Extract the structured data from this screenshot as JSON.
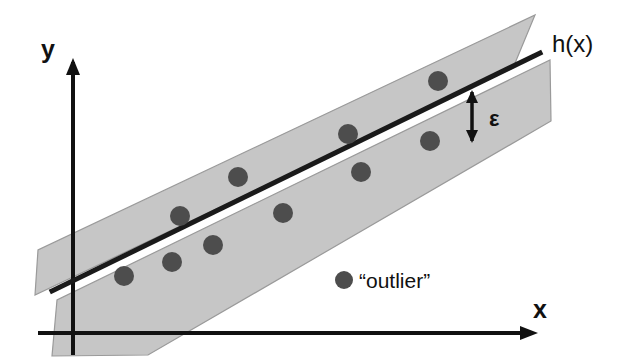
{
  "figure": {
    "background_color": "#ffffff",
    "width": 625,
    "height": 360
  },
  "colors": {
    "band_fill": "#c6c6c6",
    "band_stroke": "#9a9a9a",
    "line": "#1a1a1a",
    "axis": "#111111",
    "point": "#4d4d4d",
    "text": "#111111"
  },
  "labels": {
    "y_axis": "y",
    "x_axis": "x",
    "hypothesis": "h(x)",
    "epsilon": "ε",
    "outlier": "“outlier”"
  },
  "axes": {
    "origin": {
      "x": 73,
      "y": 333
    },
    "y_axis": {
      "x": 73,
      "y_top": 62,
      "y_bottom": 355,
      "arrow": "up"
    },
    "x_axis": {
      "y": 333,
      "x_left": 38,
      "x_right": 533,
      "arrow": "right"
    },
    "y_label_pos": {
      "x": 48,
      "y": 58
    },
    "x_label_pos": {
      "x": 540,
      "y": 318
    }
  },
  "regression_line": {
    "name": "h(x)",
    "x1": 52,
    "y1": 291,
    "x2": 540,
    "y2": 53,
    "stroke_width": 5,
    "label_pos": {
      "x": 552,
      "y": 52
    }
  },
  "bands": {
    "description": "Two offset gray parallelogram slabs forming the epsilon tube above and below h(x)",
    "upper": {
      "name": "upper-epsilon-band",
      "points": "38,250 35,295 513,68 535,15"
    },
    "lower": {
      "name": "lower-epsilon-band",
      "points": "57,300 52,356 148,355 551,121 550,60"
    }
  },
  "epsilon_marker": {
    "label": "ε",
    "arrow_x": 472,
    "arrow_top_y": 92,
    "arrow_bottom_y": 141,
    "label_pos": {
      "x": 489,
      "y": 126
    },
    "double_headed": true
  },
  "chart_data": {
    "type": "scatter",
    "xlabel": "x",
    "ylabel": "y",
    "grid": false,
    "legend": [
      "“outlier”"
    ],
    "annotations": [
      "h(x)",
      "ε",
      "“outlier”"
    ],
    "series": [
      {
        "name": "data-points",
        "marker": "filled-circle",
        "color": "#4d4d4d",
        "radius": 10,
        "points": [
          {
            "x": 124,
            "y": 276
          },
          {
            "x": 172,
            "y": 262
          },
          {
            "x": 213,
            "y": 245
          },
          {
            "x": 180,
            "y": 216
          },
          {
            "x": 238,
            "y": 177
          },
          {
            "x": 283,
            "y": 213
          },
          {
            "x": 348,
            "y": 134
          },
          {
            "x": 361,
            "y": 172
          },
          {
            "x": 430,
            "y": 141
          },
          {
            "x": 438,
            "y": 81
          }
        ]
      }
    ],
    "legend_marker": {
      "x": 344,
      "y": 280,
      "radius": 9
    },
    "legend_text_pos": {
      "x": 359,
      "y": 288
    }
  }
}
